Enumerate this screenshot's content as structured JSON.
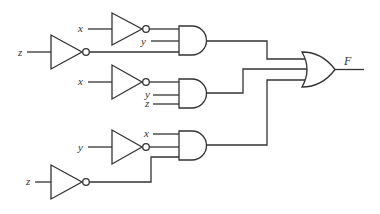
{
  "diagram": {
    "type": "logic-circuit",
    "colors": {
      "stroke": "#333333",
      "background": "#ffffff"
    },
    "inputs": [
      {
        "id": "not1_in",
        "label": "x"
      },
      {
        "id": "not2_in",
        "label": "z"
      },
      {
        "id": "and1_y",
        "label": "y"
      },
      {
        "id": "not3_in",
        "label": "x"
      },
      {
        "id": "and2_y",
        "label": "y"
      },
      {
        "id": "and2_z",
        "label": "z"
      },
      {
        "id": "and3_x",
        "label": "x"
      },
      {
        "id": "not4_in",
        "label": "y"
      },
      {
        "id": "not5_in",
        "label": "z"
      }
    ],
    "gates": [
      {
        "id": "not1",
        "type": "NOT",
        "input": "x"
      },
      {
        "id": "not2",
        "type": "NOT",
        "input": "z"
      },
      {
        "id": "and1",
        "type": "AND",
        "inputs": [
          "x'",
          "y",
          "z'"
        ]
      },
      {
        "id": "not3",
        "type": "NOT",
        "input": "x"
      },
      {
        "id": "and2",
        "type": "AND",
        "inputs": [
          "x'",
          "y",
          "z"
        ]
      },
      {
        "id": "not4",
        "type": "NOT",
        "input": "y"
      },
      {
        "id": "not5",
        "type": "NOT",
        "input": "z"
      },
      {
        "id": "and3",
        "type": "AND",
        "inputs": [
          "x",
          "y'",
          "z'"
        ]
      },
      {
        "id": "or1",
        "type": "OR",
        "inputs": [
          "and1",
          "and2",
          "and3"
        ]
      }
    ],
    "output": {
      "label": "F"
    }
  }
}
